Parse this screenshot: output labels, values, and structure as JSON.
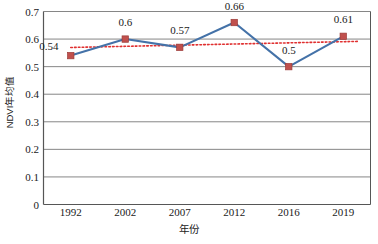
{
  "chart_data": {
    "type": "line",
    "title": "",
    "xlabel": "年份",
    "ylabel": "NDVI年均值",
    "categories": [
      "1992",
      "2002",
      "2007",
      "2012",
      "2016",
      "2019"
    ],
    "values": [
      0.54,
      0.6,
      0.57,
      0.66,
      0.5,
      0.61
    ],
    "point_labels": [
      "0.54",
      "0.6",
      "0.57",
      "0.66",
      "0.5",
      "0.61"
    ],
    "ylim": [
      0,
      0.7
    ],
    "y_ticks": [
      0,
      0.1,
      0.2,
      0.3,
      0.4,
      0.5,
      0.6,
      0.7
    ],
    "y_tick_labels": [
      "0",
      "0.1",
      "0.2",
      "0.3",
      "0.4",
      "0.5",
      "0.6",
      "0.7"
    ],
    "grid": "horizontal",
    "legend": "none",
    "series": [
      {
        "name": "NDVI年均值",
        "values": [
          0.54,
          0.6,
          0.57,
          0.66,
          0.5,
          0.61
        ],
        "line_color": "#4472A8",
        "marker_color": "#C0504D",
        "marker_shape": "square"
      },
      {
        "name": "trendline",
        "style": "dotted",
        "color": "#E03030",
        "start_value": 0.5695,
        "end_value": 0.5915
      }
    ],
    "colors": {
      "line": "#4472A8",
      "marker": "#C0504D",
      "trendline": "#E03030",
      "grid": "#868686",
      "axis": "#565656",
      "background": "#FFFFFF",
      "text": "#1A1A1A"
    }
  }
}
